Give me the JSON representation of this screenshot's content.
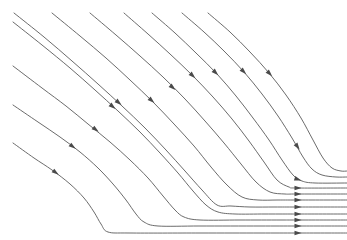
{
  "figure": {
    "type": "streamline-plot",
    "background_color": "#ffffff",
    "line_color": "#5a5a5a",
    "arrow_color": "#4a4a4a",
    "line_width": 0.9,
    "width": 347,
    "height": 240,
    "axes_visible": false,
    "gridlines_visible": false,
    "tick_labels_visible": false,
    "legend_visible": false,
    "axis_label_x": "",
    "axis_label_y": "",
    "annotations": []
  },
  "chart_data": {
    "type": "line",
    "title": "",
    "subtitle": "",
    "xlabel": "",
    "ylabel": "",
    "xlim": [
      0,
      347
    ],
    "ylim": [
      240,
      0
    ],
    "grid": false,
    "legend": "none",
    "series": [
      {
        "name": "streamline-1",
        "points": [
          [
            13,
            143
          ],
          [
            34,
            158
          ],
          [
            52,
            170
          ],
          [
            70,
            184
          ],
          [
            84,
            198
          ],
          [
            94,
            212
          ],
          [
            101,
            224
          ],
          [
            108,
            232
          ],
          [
            130,
            233
          ],
          [
            200,
            233
          ],
          [
            260,
            233
          ],
          [
            297,
            233
          ],
          [
            347,
            233
          ]
        ],
        "arrows": [
          {
            "x": 55,
            "y": 172,
            "angle": 36
          },
          {
            "x": 297,
            "y": 233,
            "angle": 0
          }
        ]
      },
      {
        "name": "streamline-2",
        "points": [
          [
            13,
            105
          ],
          [
            38,
            122
          ],
          [
            60,
            137
          ],
          [
            80,
            152
          ],
          [
            98,
            168
          ],
          [
            113,
            184
          ],
          [
            126,
            200
          ],
          [
            136,
            214
          ],
          [
            144,
            222
          ],
          [
            158,
            226
          ],
          [
            200,
            226
          ],
          [
            260,
            226
          ],
          [
            297,
            226
          ],
          [
            347,
            226
          ]
        ],
        "arrows": [
          {
            "x": 72,
            "y": 146,
            "angle": 36
          },
          {
            "x": 297,
            "y": 226,
            "angle": 0
          }
        ]
      },
      {
        "name": "streamline-3",
        "points": [
          [
            13,
            66
          ],
          [
            42,
            88
          ],
          [
            66,
            106
          ],
          [
            88,
            124
          ],
          [
            110,
            142
          ],
          [
            130,
            160
          ],
          [
            148,
            178
          ],
          [
            163,
            196
          ],
          [
            175,
            210
          ],
          [
            184,
            217
          ],
          [
            200,
            220
          ],
          [
            240,
            220
          ],
          [
            280,
            220
          ],
          [
            297,
            220
          ],
          [
            347,
            220
          ]
        ],
        "arrows": [
          {
            "x": 95,
            "y": 129,
            "angle": 37
          },
          {
            "x": 297,
            "y": 220,
            "angle": 0
          }
        ]
      },
      {
        "name": "streamline-4",
        "points": [
          [
            13,
            22
          ],
          [
            42,
            45
          ],
          [
            70,
            68
          ],
          [
            95,
            90
          ],
          [
            118,
            111
          ],
          [
            140,
            132
          ],
          [
            160,
            153
          ],
          [
            178,
            173
          ],
          [
            193,
            191
          ],
          [
            206,
            205
          ],
          [
            218,
            212
          ],
          [
            235,
            214
          ],
          [
            265,
            214
          ],
          [
            290,
            214
          ],
          [
            297,
            214
          ],
          [
            347,
            214
          ]
        ],
        "arrows": [
          {
            "x": 112,
            "y": 106,
            "angle": 39
          },
          {
            "x": 297,
            "y": 214,
            "angle": 0
          }
        ]
      },
      {
        "name": "streamline-5",
        "points": [
          [
            14,
            13
          ],
          [
            44,
            37
          ],
          [
            72,
            61
          ],
          [
            98,
            84
          ],
          [
            122,
            106
          ],
          [
            145,
            128
          ],
          [
            166,
            150
          ],
          [
            185,
            171
          ],
          [
            202,
            190
          ],
          [
            217,
            205
          ],
          [
            231,
            206
          ],
          [
            250,
            207
          ],
          [
            275,
            207
          ],
          [
            297,
            207
          ],
          [
            347,
            207
          ]
        ],
        "arrows": [
          {
            "x": 118,
            "y": 102,
            "angle": 40
          },
          {
            "x": 297,
            "y": 207,
            "angle": 0
          }
        ]
      },
      {
        "name": "streamline-6",
        "points": [
          [
            52,
            13
          ],
          [
            80,
            36
          ],
          [
            106,
            58
          ],
          [
            130,
            80
          ],
          [
            153,
            102
          ],
          [
            174,
            124
          ],
          [
            194,
            146
          ],
          [
            211,
            167
          ],
          [
            227,
            185
          ],
          [
            242,
            197
          ],
          [
            258,
            200
          ],
          [
            278,
            200
          ],
          [
            297,
            200
          ],
          [
            347,
            200
          ]
        ],
        "arrows": [
          {
            "x": 151,
            "y": 100,
            "angle": 41
          },
          {
            "x": 297,
            "y": 200,
            "angle": 0
          }
        ]
      },
      {
        "name": "streamline-7",
        "points": [
          [
            90,
            13
          ],
          [
            116,
            35
          ],
          [
            140,
            56
          ],
          [
            163,
            77
          ],
          [
            185,
            99
          ],
          [
            205,
            121
          ],
          [
            224,
            143
          ],
          [
            241,
            164
          ],
          [
            256,
            182
          ],
          [
            270,
            192
          ],
          [
            285,
            194
          ],
          [
            297,
            194
          ],
          [
            347,
            194
          ]
        ],
        "arrows": [
          {
            "x": 172,
            "y": 87,
            "angle": 42
          },
          {
            "x": 297,
            "y": 194,
            "angle": 0
          }
        ]
      },
      {
        "name": "streamline-8",
        "points": [
          [
            124,
            13
          ],
          [
            148,
            34
          ],
          [
            170,
            54
          ],
          [
            192,
            75
          ],
          [
            213,
            97
          ],
          [
            232,
            119
          ],
          [
            249,
            141
          ],
          [
            264,
            162
          ],
          [
            277,
            180
          ],
          [
            289,
            187
          ],
          [
            297,
            188
          ],
          [
            347,
            188
          ]
        ],
        "arrows": [
          {
            "x": 192,
            "y": 75,
            "angle": 43
          },
          {
            "x": 297,
            "y": 188,
            "angle": 0
          }
        ]
      },
      {
        "name": "streamline-9",
        "points": [
          [
            152,
            13
          ],
          [
            175,
            33
          ],
          [
            196,
            53
          ],
          [
            217,
            74
          ],
          [
            236,
            96
          ],
          [
            253,
            118
          ],
          [
            269,
            140
          ],
          [
            282,
            160
          ],
          [
            293,
            175
          ],
          [
            302,
            181
          ],
          [
            315,
            183
          ],
          [
            347,
            183
          ]
        ],
        "arrows": [
          {
            "x": 215,
            "y": 72,
            "angle": 44
          },
          {
            "x": 297,
            "y": 179,
            "angle": 18
          }
        ]
      },
      {
        "name": "streamline-10",
        "points": [
          [
            182,
            13
          ],
          [
            204,
            32
          ],
          [
            224,
            51
          ],
          [
            244,
            72
          ],
          [
            262,
            94
          ],
          [
            278,
            116
          ],
          [
            292,
            138
          ],
          [
            303,
            157
          ],
          [
            312,
            169
          ],
          [
            322,
            175
          ],
          [
            336,
            177
          ],
          [
            347,
            177
          ]
        ],
        "arrows": [
          {
            "x": 243,
            "y": 71,
            "angle": 45
          },
          {
            "x": 297,
            "y": 146,
            "angle": 55
          }
        ]
      },
      {
        "name": "streamline-11",
        "points": [
          [
            208,
            13
          ],
          [
            230,
            32
          ],
          [
            250,
            52
          ],
          [
            269,
            73
          ],
          [
            286,
            95
          ],
          [
            301,
            118
          ],
          [
            313,
            140
          ],
          [
            323,
            158
          ],
          [
            332,
            168
          ],
          [
            341,
            171
          ],
          [
            347,
            171
          ]
        ],
        "arrows": [
          {
            "x": 269,
            "y": 73,
            "angle": 46
          }
        ]
      }
    ]
  }
}
